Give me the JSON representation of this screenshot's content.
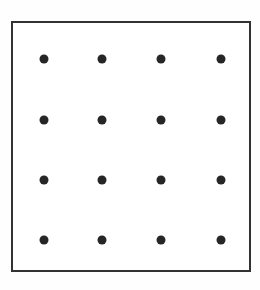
{
  "figure": {
    "name": "dot-grid-square",
    "canvas": {
      "width": 260,
      "height": 290,
      "background": "#fefefe"
    },
    "frame": {
      "name": "plot-frame",
      "x": 11,
      "y": 21,
      "width": 240,
      "height": 251,
      "border_width": 2,
      "border_color": "#323232",
      "fill_color": "#ffffff"
    },
    "dot_style": {
      "color": "#262626",
      "diameter": 9,
      "shape": "circle"
    }
  },
  "chart_data": {
    "type": "scatter",
    "title": "",
    "subtitle": "",
    "xlabel": "",
    "ylabel": "",
    "grid": false,
    "legend": null,
    "legend_position": "none",
    "xlim": [
      11,
      251
    ],
    "ylim": [
      21,
      272
    ],
    "axis_ticks": {
      "x": [],
      "y": []
    },
    "annotations": [],
    "marker": {
      "shape": "circle",
      "size": 9,
      "color": "#262626",
      "filled": true
    },
    "rows": 4,
    "columns": 4,
    "column_x": [
      44,
      102,
      161,
      221
    ],
    "row_y": [
      59,
      120,
      180,
      240
    ],
    "points": [
      {
        "x": 44,
        "y": 59,
        "row": 1,
        "col": 1
      },
      {
        "x": 102,
        "y": 59,
        "row": 1,
        "col": 2
      },
      {
        "x": 161,
        "y": 59,
        "row": 1,
        "col": 3
      },
      {
        "x": 221,
        "y": 59,
        "row": 1,
        "col": 4
      },
      {
        "x": 44,
        "y": 120,
        "row": 2,
        "col": 1
      },
      {
        "x": 102,
        "y": 120,
        "row": 2,
        "col": 2
      },
      {
        "x": 161,
        "y": 120,
        "row": 2,
        "col": 3
      },
      {
        "x": 221,
        "y": 120,
        "row": 2,
        "col": 4
      },
      {
        "x": 44,
        "y": 180,
        "row": 3,
        "col": 1
      },
      {
        "x": 102,
        "y": 180,
        "row": 3,
        "col": 2
      },
      {
        "x": 161,
        "y": 180,
        "row": 3,
        "col": 3
      },
      {
        "x": 221,
        "y": 180,
        "row": 3,
        "col": 4
      },
      {
        "x": 44,
        "y": 240,
        "row": 4,
        "col": 1
      },
      {
        "x": 102,
        "y": 240,
        "row": 4,
        "col": 2
      },
      {
        "x": 161,
        "y": 240,
        "row": 4,
        "col": 3
      },
      {
        "x": 221,
        "y": 240,
        "row": 4,
        "col": 4
      }
    ]
  }
}
